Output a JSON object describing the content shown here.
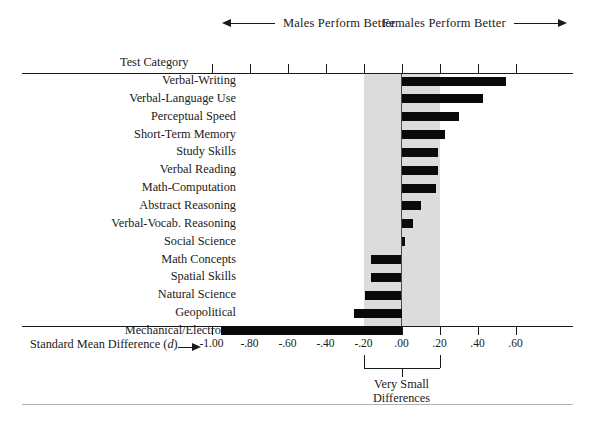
{
  "header": {
    "males_label": "Males Perform Better",
    "females_label": "Females Perform Better"
  },
  "axes": {
    "category_header": "Test Category",
    "x_title": "Standard Mean Difference (",
    "x_title_italic": "d",
    "x_title_close": ")",
    "tick_labels": [
      "-1.00",
      "-.80",
      "-.60",
      "-.40",
      "-.20",
      ".00",
      ".20",
      ".40",
      ".60"
    ],
    "tick_values": [
      -1.0,
      -0.8,
      -0.6,
      -0.4,
      -0.2,
      0.0,
      0.2,
      0.4,
      0.6
    ]
  },
  "annotation": {
    "brace_line1": "Very Small",
    "brace_line2": "Differences",
    "brace_from": -0.2,
    "brace_to": 0.2
  },
  "colors": {
    "bar": "#0a0a0a",
    "band": "#dcdcdc",
    "axis": "#1a1a1a",
    "zero_line": "#4a4a4a",
    "bottom_rule": "#b3b3b3"
  },
  "chart_data": {
    "type": "bar",
    "orientation": "horizontal",
    "title": "",
    "xlabel": "Standard Mean Difference (d)",
    "ylabel": "Test Category",
    "xlim": [
      -1.1,
      0.7
    ],
    "grid": false,
    "legend": "none",
    "categories": [
      "Verbal-Writing",
      "Verbal-Language Use",
      "Perceptual Speed",
      "Short-Term Memory",
      "Study Skills",
      "Verbal Reading",
      "Math-Computation",
      "Abstract Reasoning",
      "Verbal-Vocab. Reasoning",
      "Social Science",
      "Math Concepts",
      "Spatial Skills",
      "Natural Science",
      "Geopolitical",
      "Mechanical/Electronic"
    ],
    "values": [
      0.55,
      0.43,
      0.3,
      0.23,
      0.19,
      0.19,
      0.18,
      0.1,
      0.06,
      0.02,
      -0.16,
      -0.16,
      -0.19,
      -0.25,
      -0.95
    ],
    "annotations": [
      "Males Perform Better",
      "Females Perform Better",
      "Very Small Differences"
    ]
  }
}
